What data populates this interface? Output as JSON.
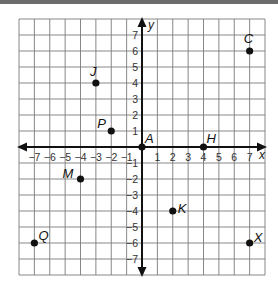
{
  "chart_data": {
    "type": "scatter",
    "title": "",
    "xlabel": "x",
    "ylabel": "y",
    "xlim": [
      -8,
      8
    ],
    "ylim": [
      -8,
      8
    ],
    "grid": true,
    "x_ticks": [
      -7,
      -6,
      -5,
      -4,
      -3,
      -2,
      -1,
      1,
      2,
      3,
      4,
      5,
      6,
      7
    ],
    "y_ticks": [
      -7,
      -6,
      -5,
      -4,
      -3,
      -2,
      -1,
      1,
      2,
      3,
      4,
      5,
      6,
      7
    ],
    "points": [
      {
        "label": "C",
        "x": 7,
        "y": 6
      },
      {
        "label": "J",
        "x": -3,
        "y": 4
      },
      {
        "label": "P",
        "x": -2,
        "y": 1
      },
      {
        "label": "A",
        "x": 0,
        "y": 0
      },
      {
        "label": "H",
        "x": 4,
        "y": 0
      },
      {
        "label": "M",
        "x": -4,
        "y": -2
      },
      {
        "label": "K",
        "x": 2,
        "y": -4
      },
      {
        "label": "Q",
        "x": -7,
        "y": -6
      },
      {
        "label": "X",
        "x": 7,
        "y": -6
      }
    ]
  },
  "labels": {
    "x_axis": "x",
    "y_axis": "y"
  }
}
